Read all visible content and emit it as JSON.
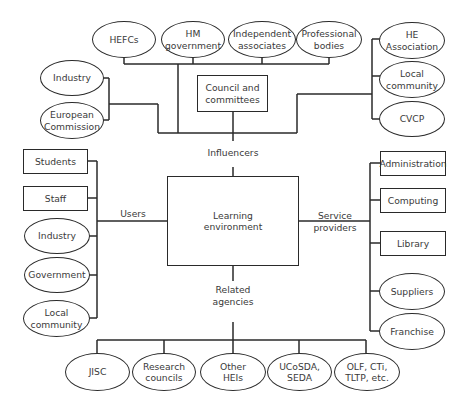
{
  "diagram": {
    "center": {
      "label": "Learning\nenvironment"
    },
    "groups": {
      "influencers": {
        "label": "Influencers",
        "council": "Council and\ncommittees",
        "top": [
          "HEFCs",
          "HM\ngovernment",
          "Independent\nassociates",
          "Professional\nbodies"
        ],
        "left": [
          "Industry",
          "European\nCommission"
        ],
        "right": [
          "HE\nAssociation",
          "Local\ncommunity",
          "CVCP"
        ]
      },
      "users": {
        "label": "Users",
        "items": [
          "Students",
          "Staff",
          "Industry",
          "Government",
          "Local\ncommunity"
        ]
      },
      "service_providers": {
        "label": "Service\nproviders",
        "items": [
          "Administration",
          "Computing",
          "Library",
          "Suppliers",
          "Franchise"
        ]
      },
      "related_agencies": {
        "label": "Related\nagencies",
        "items": [
          "JISC",
          "Research\ncouncils",
          "Other\nHEIs",
          "UCoSDA,\nSEDA",
          "OLF, CTi,\nTLTP, etc."
        ]
      }
    },
    "colors": {
      "line": "#2a2a2a",
      "text": "#3a3a3a",
      "background": "#ffffff"
    }
  }
}
